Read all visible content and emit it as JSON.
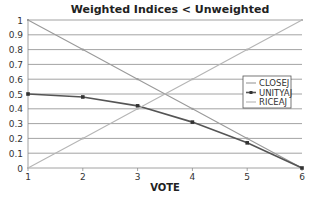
{
  "chart_data": {
    "type": "line",
    "title": "Weighted Indices < Unweighted",
    "xlabel": "VOTE",
    "ylabel": "",
    "x": [
      1,
      2,
      3,
      4,
      5,
      6
    ],
    "xlim": [
      1,
      6
    ],
    "ylim": [
      0,
      1
    ],
    "x_ticks": [
      "1",
      "2",
      "3",
      "4",
      "5",
      "6"
    ],
    "y_ticks": [
      "0",
      "0.1",
      "0.2",
      "0.3",
      "0.4",
      "0.5",
      "0.6",
      "0.7",
      "0.8",
      "0.9",
      "1"
    ],
    "grid": "horizontal",
    "legend_position": "right",
    "series": [
      {
        "name": "CLOSEJ",
        "values": [
          1.0,
          0.8,
          0.6,
          0.4,
          0.2,
          0.0
        ],
        "color": "#9a9a9a",
        "marker": "none"
      },
      {
        "name": "UNITYAJ",
        "values": [
          0.5,
          0.48,
          0.42,
          0.31,
          0.17,
          0.0
        ],
        "color": "#555555",
        "marker": "square"
      },
      {
        "name": "RICEAJ",
        "values": [
          0.0,
          0.2,
          0.4,
          0.6,
          0.8,
          1.0
        ],
        "color": "#b5b5b5",
        "marker": "none"
      }
    ]
  }
}
